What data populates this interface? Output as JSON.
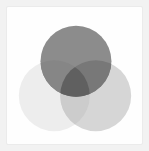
{
  "figure": {
    "type": "venn",
    "background_color": "#f2f2f2",
    "card_color": "#fefefe",
    "card_border_color": "#ebebeb"
  },
  "chart_data": {
    "type": "venn",
    "subtitle": "",
    "xlabel": "",
    "ylabel": "",
    "grid": false,
    "legend_position": "none",
    "sets": [
      {
        "name": "set-a",
        "label": "",
        "position": "top",
        "cx": 70,
        "cy": 55,
        "r": 36,
        "fill": "#8c8c8c",
        "opacity": 1
      },
      {
        "name": "set-b",
        "label": "",
        "position": "bottom-left",
        "cx": 48,
        "cy": 90,
        "r": 36,
        "fill": "#ededed",
        "opacity": 1
      },
      {
        "name": "set-c",
        "label": "",
        "position": "bottom-right",
        "cx": 90,
        "cy": 90,
        "r": 36,
        "fill": "#d6d6d6",
        "opacity": 1
      }
    ],
    "intersections": [
      {
        "name": "a-b",
        "sets": [
          "set-a",
          "set-b"
        ],
        "fill": "#868686"
      },
      {
        "name": "a-c",
        "sets": [
          "set-a",
          "set-c"
        ],
        "fill": "#787878"
      },
      {
        "name": "b-c",
        "sets": [
          "set-b",
          "set-c"
        ],
        "fill": "#cccccc"
      },
      {
        "name": "a-b-c",
        "sets": [
          "set-a",
          "set-b",
          "set-c"
        ],
        "fill": "#606060"
      }
    ],
    "blend_mode": "multiply",
    "axis_visible": false,
    "ylim": [
      0,
      139
    ],
    "xlim": [
      0,
      137
    ]
  }
}
